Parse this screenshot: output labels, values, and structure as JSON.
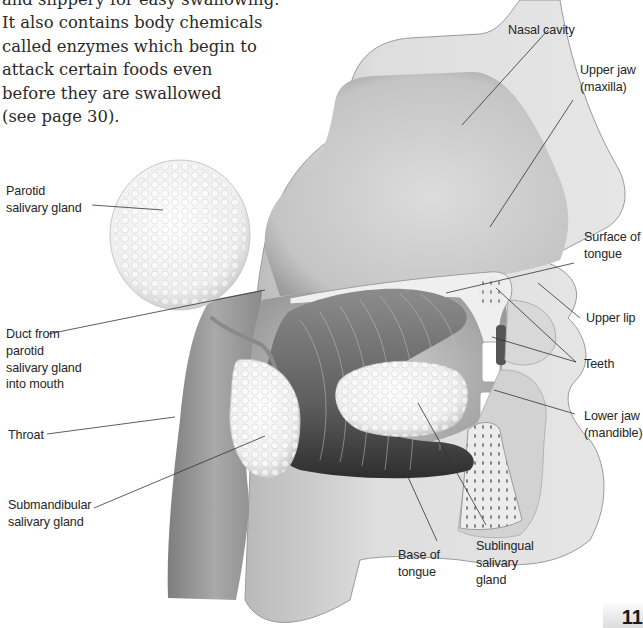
{
  "intro_text": {
    "lines": [
      "and slippery for easy swallowing.",
      "It also contains body chemicals",
      "called enzymes which begin to",
      "attack certain foods even",
      "before they are swallowed",
      "(see page 30)."
    ]
  },
  "diagram": {
    "labels": {
      "nasal_cavity": [
        "Nasal cavity"
      ],
      "upper_jaw": [
        "Upper jaw",
        "(maxilla)"
      ],
      "parotid": [
        "Parotid",
        "salivary gland"
      ],
      "surface_of_tongue": [
        "Surface of",
        "tongue"
      ],
      "upper_lip": [
        "Upper lip"
      ],
      "duct": [
        "Duct from",
        "parotid",
        "salivary gland",
        "into mouth"
      ],
      "teeth": [
        "Teeth"
      ],
      "lower_jaw": [
        "Lower jaw",
        "(mandible)"
      ],
      "throat": [
        "Throat"
      ],
      "submandibular": [
        "Submandibular",
        "salivary gland"
      ],
      "base_of_tongue": [
        "Base of",
        "tongue"
      ],
      "sublingual": [
        "Sublingual",
        "salivary",
        "gland"
      ]
    },
    "colors": {
      "head_fill": "#d9d9d9",
      "cavity_fill": "#c8c8c8",
      "gland_fill": "#f2f2f2",
      "tongue_fill": "#6a6a6a",
      "leader_line": "#333333"
    }
  },
  "page": {
    "number": "11"
  }
}
